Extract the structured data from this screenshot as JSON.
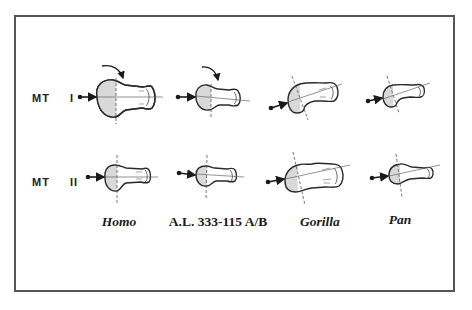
{
  "figure": {
    "rows": [
      {
        "id": "mt1",
        "label": "MT  I"
      },
      {
        "id": "mt2",
        "label": "MT  II"
      }
    ],
    "columns": [
      {
        "id": "homo",
        "label": "Homo",
        "italic": true
      },
      {
        "id": "al333",
        "label": "A.L. 333-115 A/B",
        "italic": false
      },
      {
        "id": "gorilla",
        "label": "Gorilla",
        "italic": true
      },
      {
        "id": "pan",
        "label": "Pan",
        "italic": true
      }
    ],
    "annotations": {
      "rotation_arrows": [
        "homo-mt1",
        "al333-mt1"
      ],
      "shaded_region": "metatarsal head articular surface",
      "axis_lines": "dashed vertical + solid longitudinal"
    },
    "colors": {
      "frame": "#555555",
      "outline": "#2a2a2a",
      "shading": "#d9d9d9",
      "text": "#1a1a1a"
    }
  }
}
